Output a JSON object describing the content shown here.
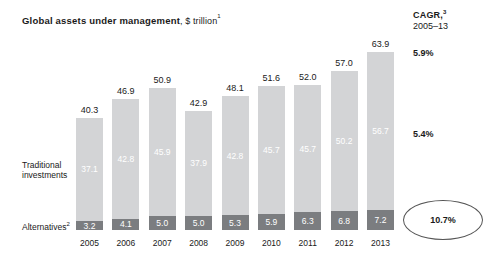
{
  "title": {
    "main": "Global assets under management",
    "sub": ", $ trillion",
    "sub_superscript": "1"
  },
  "cagr_header": {
    "label": "CAGR,",
    "label_superscript": "3",
    "period": "2005–13"
  },
  "cagr_values": {
    "total": "5.9%",
    "traditional": "5.4%",
    "alternatives": "10.7%"
  },
  "row_labels": {
    "traditional_line1": "Traditional",
    "traditional_line2": "investments",
    "alternatives": "Alternatives",
    "alternatives_superscript": "2"
  },
  "chart_data": {
    "type": "bar",
    "title": "Global assets under management, $ trillion",
    "xlabel": "",
    "ylabel": "$ trillion",
    "ylim": [
      0,
      63.9
    ],
    "grid": false,
    "legend_position": "left-row-labels",
    "stacked": true,
    "categories": [
      "2005",
      "2006",
      "2007",
      "2008",
      "2009",
      "2010",
      "2011",
      "2012",
      "2013"
    ],
    "totals": [
      40.3,
      46.9,
      50.9,
      42.9,
      48.1,
      51.6,
      52.0,
      57.0,
      63.9
    ],
    "series": [
      {
        "name": "Traditional investments",
        "color": "#d3d4d6",
        "values": [
          37.1,
          42.8,
          45.9,
          37.9,
          42.8,
          45.7,
          45.7,
          50.2,
          56.7
        ]
      },
      {
        "name": "Alternatives",
        "color": "#7b7d80",
        "values": [
          3.2,
          4.1,
          5.0,
          5.0,
          5.3,
          5.9,
          6.3,
          6.8,
          7.2
        ]
      }
    ],
    "annotations": {
      "cagr_period": "2005–13",
      "cagr_total": "5.9%",
      "cagr_traditional": "5.4%",
      "cagr_alternatives": "10.7%"
    }
  },
  "colors": {
    "traditional": "#d3d4d6",
    "alternatives": "#7b7d80",
    "text": "#1a1a1a",
    "background": "#ffffff"
  }
}
